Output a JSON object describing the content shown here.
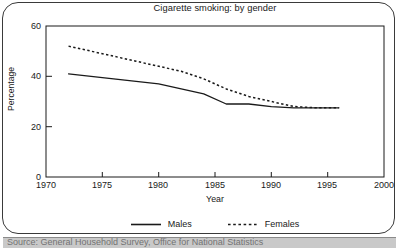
{
  "figure": {
    "title": "Cigarette smoking: by gender",
    "source": "Source: General Household Survey, Office for National Statistics"
  },
  "chart_data": {
    "type": "line",
    "title": "Cigarette smoking: by gender",
    "xlabel": "Year",
    "ylabel": "Percentage",
    "xlim": [
      1970,
      2000
    ],
    "ylim": [
      0,
      60
    ],
    "xticks": [
      1970,
      1975,
      1980,
      1985,
      1990,
      1995,
      2000
    ],
    "yticks": [
      0,
      20,
      40,
      60
    ],
    "grid": false,
    "legend_position": "bottom",
    "series": [
      {
        "name": "Males",
        "style": "solid",
        "color": "#1a1a1a",
        "x": [
          1972,
          1974,
          1976,
          1978,
          1980,
          1982,
          1984,
          1986,
          1988,
          1990,
          1992,
          1994,
          1996
        ],
        "values": [
          41,
          40,
          39,
          38,
          37,
          35,
          33,
          29,
          29,
          28,
          27.5,
          27.5,
          27.5
        ]
      },
      {
        "name": "Females",
        "style": "dotted",
        "color": "#1a1a1a",
        "x": [
          1972,
          1974,
          1976,
          1978,
          1980,
          1982,
          1984,
          1986,
          1988,
          1990,
          1992,
          1994,
          1996
        ],
        "values": [
          52,
          50,
          48,
          46,
          44,
          42,
          39,
          35,
          32,
          30,
          28,
          27.5,
          27.5
        ]
      }
    ]
  },
  "axes": {
    "y_title": "Percentage",
    "x_title": "Year",
    "y_ticks": [
      "0",
      "20",
      "40",
      "60"
    ],
    "x_ticks": [
      "1970",
      "1975",
      "1980",
      "1985",
      "1990",
      "1995",
      "2000"
    ]
  },
  "legend": {
    "items": [
      {
        "label": "Males",
        "style": "solid"
      },
      {
        "label": "Females",
        "style": "dotted"
      }
    ]
  }
}
